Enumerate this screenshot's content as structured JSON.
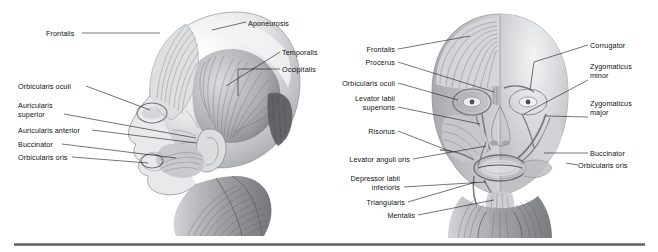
{
  "figure": {
    "background_color": "#ffffff",
    "label_color": "#111111",
    "leader_line_color": "#1a1a1a",
    "divider_color": "#5f6368"
  },
  "lateral_view": {
    "name": "lateral-head-view",
    "labels_left": [
      {
        "text": "Frontalis",
        "x": 46,
        "y": 29,
        "align": "left"
      },
      {
        "text": "Orbicularis oculi",
        "x": 18,
        "y": 82,
        "align": "left"
      },
      {
        "text": "Auricularis\nsuperior",
        "x": 18,
        "y": 101,
        "align": "left"
      },
      {
        "text": "Auricularis anterior",
        "x": 18,
        "y": 126,
        "align": "left"
      },
      {
        "text": "Buccinator",
        "x": 18,
        "y": 140,
        "align": "left"
      },
      {
        "text": "Orbicularis oris",
        "x": 18,
        "y": 153,
        "align": "left"
      }
    ],
    "labels_right": [
      {
        "text": "Aponeurosis",
        "x": 248,
        "y": 19,
        "align": "left"
      },
      {
        "text": "Temporalis",
        "x": 282,
        "y": 48,
        "align": "left"
      },
      {
        "text": "Occipitalis",
        "x": 282,
        "y": 65,
        "align": "left"
      }
    ]
  },
  "frontal_view": {
    "name": "frontal-head-view",
    "labels_left": [
      {
        "text": "Frontalis",
        "x": 395,
        "y": 45,
        "align": "right"
      },
      {
        "text": "Procerus",
        "x": 395,
        "y": 58,
        "align": "right"
      },
      {
        "text": "Orbicularis oculi",
        "x": 395,
        "y": 79,
        "align": "right"
      },
      {
        "text": "Levator labii\nsuperioris",
        "x": 395,
        "y": 94,
        "align": "right"
      },
      {
        "text": "Risorius",
        "x": 395,
        "y": 127,
        "align": "right"
      },
      {
        "text": "Levator anguli oris",
        "x": 410,
        "y": 155,
        "align": "right"
      },
      {
        "text": "Depressor labii\ninferioris",
        "x": 400,
        "y": 174,
        "align": "right"
      },
      {
        "text": "Triangularis",
        "x": 405,
        "y": 198,
        "align": "right"
      },
      {
        "text": "Mentalis",
        "x": 415,
        "y": 215,
        "align": "right"
      }
    ],
    "labels_right": [
      {
        "text": "Corrugator",
        "x": 590,
        "y": 41,
        "align": "left"
      },
      {
        "text": "Zygomaticus\nminor",
        "x": 590,
        "y": 62,
        "align": "left"
      },
      {
        "text": "Zygomaticus\nmajor",
        "x": 590,
        "y": 99,
        "align": "left"
      },
      {
        "text": "Buccinator",
        "x": 590,
        "y": 149,
        "align": "left"
      },
      {
        "text": "Orbicularis oris",
        "x": 578,
        "y": 161,
        "align": "left"
      }
    ]
  }
}
